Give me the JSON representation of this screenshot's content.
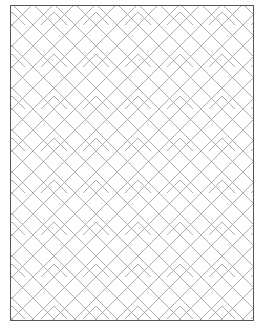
{
  "figure": {
    "line_color": "#9a9a9a",
    "frame_color": "#555555",
    "background": "#ffffff"
  }
}
